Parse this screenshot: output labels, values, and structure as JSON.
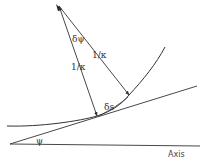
{
  "diagram": {
    "labels": {
      "delta_psi": "δψ",
      "radius_right": "1/κ",
      "radius_left": "1/κ",
      "delta_s": "δs",
      "psi": "ψ",
      "axis": "Axis"
    },
    "colors": {
      "stroke": "#333333",
      "background": "#ffffff"
    }
  }
}
